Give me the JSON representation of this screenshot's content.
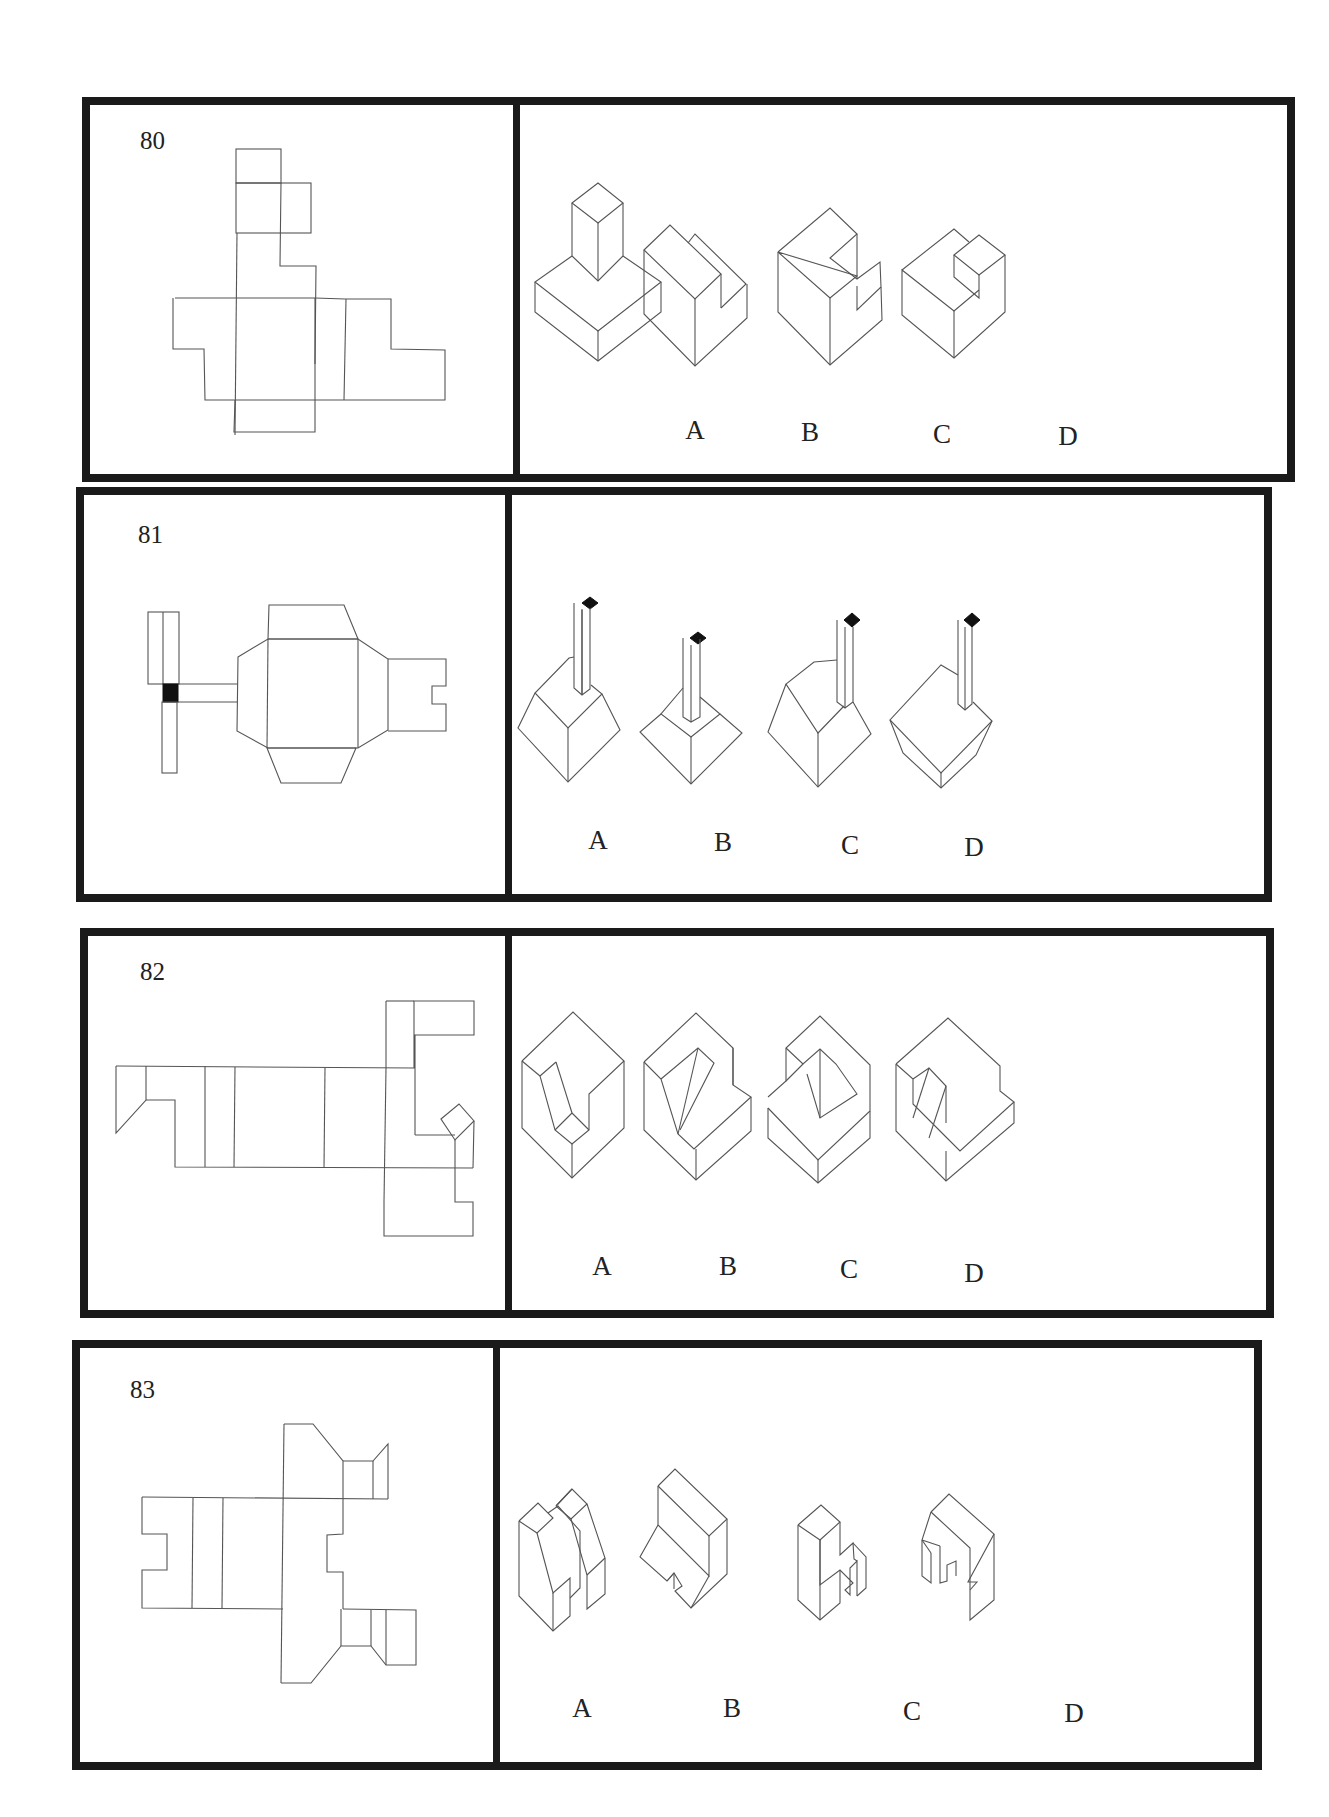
{
  "questions": [
    {
      "number": "80",
      "options": [
        "A",
        "B",
        "C",
        "D"
      ]
    },
    {
      "number": "81",
      "options": [
        "A",
        "B",
        "C",
        "D"
      ]
    },
    {
      "number": "82",
      "options": [
        "A",
        "B",
        "C",
        "D"
      ]
    },
    {
      "number": "83",
      "options": [
        "A",
        "B",
        "C",
        "D"
      ]
    }
  ]
}
